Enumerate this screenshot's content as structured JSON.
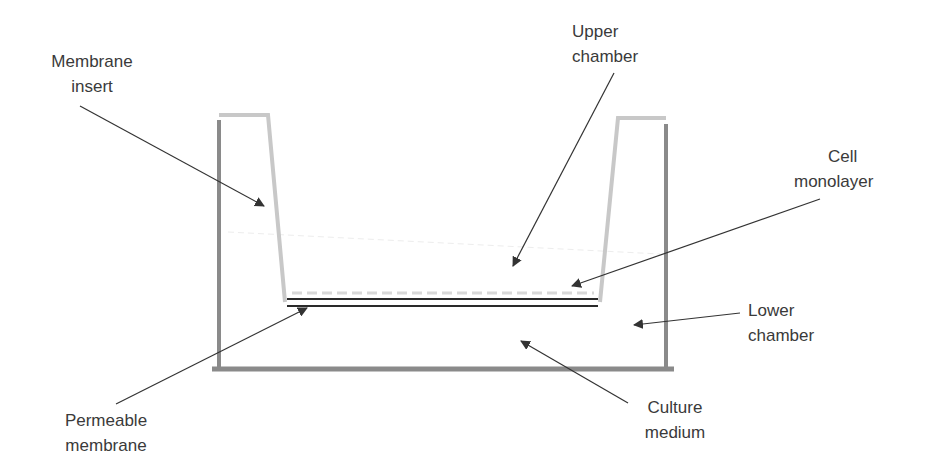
{
  "diagram": {
    "type": "transwell-insert-schematic",
    "colors": {
      "outer_well": "#8a8a8a",
      "insert_wall": "#c8c8c8",
      "membrane": "#2a2a2a",
      "arrow": "#333333",
      "text": "#3a3a3a",
      "medium_line": "#e6e6e6",
      "cell_dots": "#d8d8d8"
    },
    "labels": {
      "membrane_insert": {
        "line1": "Membrane",
        "line2": "insert"
      },
      "upper_chamber": {
        "line1": "Upper",
        "line2": "chamber"
      },
      "cell_monolayer": {
        "line1": "Cell",
        "line2": "monolayer"
      },
      "lower_chamber": {
        "line1": "Lower",
        "line2": "chamber"
      },
      "permeable_membrane": {
        "line1": "Permeable",
        "line2": "membrane"
      },
      "culture_medium": {
        "line1": "Culture",
        "line2": "medium"
      }
    }
  }
}
